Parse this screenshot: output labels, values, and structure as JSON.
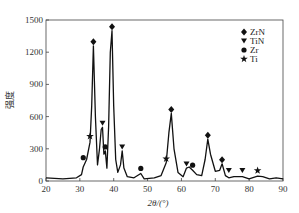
{
  "chart_data": {
    "type": "line",
    "title": "",
    "xlabel": "2θ/(°)",
    "ylabel": "强度",
    "xlim": [
      20,
      90
    ],
    "ylim": [
      0,
      1500
    ],
    "xticks": [
      20,
      30,
      40,
      50,
      60,
      70,
      80,
      90
    ],
    "yticks": [
      0,
      300,
      600,
      900,
      1200,
      1500
    ],
    "legend": {
      "placement": "top-right",
      "entries": [
        {
          "label": "ZrN",
          "marker": "diamond"
        },
        {
          "label": "TiN",
          "marker": "triangle-down"
        },
        {
          "label": "Zr",
          "marker": "circle"
        },
        {
          "label": "Ti",
          "marker": "star"
        }
      ]
    },
    "series": [
      {
        "name": "XRD pattern",
        "x": [
          20,
          25,
          29,
          30.5,
          31,
          32,
          33,
          33.5,
          34,
          34.6,
          35.2,
          35.8,
          36.3,
          36.7,
          37.1,
          37.5,
          38,
          38.5,
          39,
          39.5,
          40,
          40.6,
          41.2,
          42,
          42.5,
          43,
          44,
          46,
          48,
          49,
          52,
          54,
          55.5,
          56.3,
          57,
          57.8,
          59,
          60.5,
          61.5,
          62.3,
          63.3,
          64.5,
          66,
          67,
          67.8,
          68.6,
          70,
          71.3,
          72,
          73,
          74,
          75.5,
          78,
          80,
          82.5,
          84,
          86,
          88,
          90
        ],
        "y": [
          30,
          20,
          30,
          60,
          130,
          200,
          360,
          700,
          1260,
          600,
          150,
          300,
          480,
          500,
          250,
          280,
          120,
          500,
          1200,
          1400,
          700,
          200,
          80,
          150,
          280,
          120,
          40,
          30,
          70,
          20,
          30,
          50,
          170,
          450,
          630,
          300,
          80,
          40,
          120,
          130,
          100,
          60,
          50,
          200,
          390,
          250,
          90,
          100,
          160,
          50,
          30,
          40,
          40,
          20,
          45,
          40,
          20,
          30,
          20
        ]
      }
    ],
    "markers": [
      {
        "phase": "ZrN",
        "marker": "diamond",
        "x": 34,
        "y": 1260
      },
      {
        "phase": "ZrN",
        "marker": "diamond",
        "x": 39.5,
        "y": 1400
      },
      {
        "phase": "ZrN",
        "marker": "diamond",
        "x": 57,
        "y": 630
      },
      {
        "phase": "ZrN",
        "marker": "diamond",
        "x": 67.8,
        "y": 390
      },
      {
        "phase": "ZrN",
        "marker": "diamond",
        "x": 72,
        "y": 160
      },
      {
        "phase": "TiN",
        "marker": "triangle-down",
        "x": 36.7,
        "y": 500
      },
      {
        "phase": "TiN",
        "marker": "triangle-down",
        "x": 42.5,
        "y": 280
      },
      {
        "phase": "TiN",
        "marker": "triangle-down",
        "x": 61.5,
        "y": 120
      },
      {
        "phase": "TiN",
        "marker": "triangle-down",
        "x": 74,
        "y": 60
      },
      {
        "phase": "TiN",
        "marker": "triangle-down",
        "x": 78,
        "y": 60
      },
      {
        "phase": "Zr",
        "marker": "circle",
        "x": 31,
        "y": 180
      },
      {
        "phase": "Zr",
        "marker": "circle",
        "x": 37.5,
        "y": 280
      },
      {
        "phase": "Zr",
        "marker": "circle",
        "x": 48,
        "y": 80
      },
      {
        "phase": "Zr",
        "marker": "circle",
        "x": 63.3,
        "y": 110
      },
      {
        "phase": "Ti",
        "marker": "star",
        "x": 33,
        "y": 380
      },
      {
        "phase": "Ti",
        "marker": "star",
        "x": 55.5,
        "y": 170
      },
      {
        "phase": "Ti",
        "marker": "star",
        "x": 82.5,
        "y": 60
      }
    ],
    "grid": false
  }
}
